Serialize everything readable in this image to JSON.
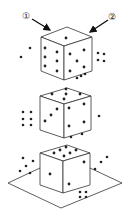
{
  "diagram": {
    "title": "",
    "labels": [
      {
        "id": "view-1",
        "text": "①",
        "x": 22,
        "y": 11
      },
      {
        "id": "view-2",
        "text": "②",
        "x": 108,
        "y": 12
      }
    ],
    "arrows": [
      {
        "from": [
          32,
          19
        ],
        "to": [
          50,
          30
        ]
      },
      {
        "from": [
          108,
          20
        ],
        "to": [
          90,
          32
        ]
      }
    ],
    "colors": {
      "stroke": "#333333",
      "dot": "#222222",
      "background": "#ffffff"
    },
    "dice": [
      {
        "name": "top-die",
        "top": [
          67,
          27
        ],
        "left": [
          41,
          37
        ],
        "right": [
          92,
          37
        ],
        "front": [
          64,
          46
        ],
        "height": 34,
        "faces": {
          "top": 1,
          "left": 6,
          "right": 5
        },
        "dots": [
          [
            66,
            38
          ],
          [
            45,
            48
          ],
          [
            45,
            57
          ],
          [
            45,
            66
          ],
          [
            57,
            52
          ],
          [
            57,
            61
          ],
          [
            57,
            71
          ],
          [
            70,
            54
          ],
          [
            84,
            50
          ],
          [
            77,
            61
          ],
          [
            70,
            71
          ],
          [
            84,
            67
          ]
        ],
        "outside_dots": [
          [
            21,
            57
          ],
          [
            30,
            48
          ],
          [
            98,
            53
          ],
          [
            104,
            54
          ],
          [
            98,
            60
          ],
          [
            104,
            61
          ],
          [
            77,
            78
          ],
          [
            81,
            76
          ],
          [
            85,
            74
          ]
        ]
      },
      {
        "name": "middle-die",
        "top": [
          67,
          88
        ],
        "left": [
          40,
          96
        ],
        "right": [
          91,
          96
        ],
        "front": [
          64,
          104
        ],
        "height": 34,
        "faces": {
          "top": 5,
          "left": 3,
          "right": 4
        },
        "dots": [
          [
            52,
            94
          ],
          [
            66,
            89
          ],
          [
            66,
            94
          ],
          [
            80,
            94
          ],
          [
            64,
            99
          ],
          [
            57,
            109
          ],
          [
            51,
            115
          ],
          [
            45,
            121
          ],
          [
            69,
            108
          ],
          [
            84,
            104
          ],
          [
            69,
            126
          ],
          [
            84,
            122
          ]
        ],
        "outside_dots": [
          [
            23,
            112
          ],
          [
            31,
            112
          ],
          [
            23,
            119
          ],
          [
            31,
            119
          ],
          [
            23,
            125
          ],
          [
            31,
            125
          ],
          [
            99,
            116
          ],
          [
            71,
            137
          ],
          [
            82,
            134
          ]
        ]
      },
      {
        "name": "bottom-die",
        "top": [
          67,
          145
        ],
        "left": [
          40,
          153
        ],
        "right": [
          90,
          153
        ],
        "front": [
          63,
          161
        ],
        "height": 32,
        "faces": {
          "top": 6,
          "left": 1,
          "right": 2
        },
        "dots": [
          [
            54,
            153
          ],
          [
            60,
            150
          ],
          [
            66,
            147
          ],
          [
            64,
            156
          ],
          [
            70,
            153
          ],
          [
            76,
            150
          ],
          [
            50,
            174
          ],
          [
            84,
            162
          ],
          [
            69,
            184
          ]
        ],
        "outside_dots": [
          [
            23,
            158
          ],
          [
            33,
            161
          ],
          [
            26,
            166
          ],
          [
            20,
            171
          ],
          [
            30,
            173
          ],
          [
            107,
            157
          ],
          [
            101,
            162
          ],
          [
            95,
            169
          ],
          [
            80,
            192
          ],
          [
            86,
            192
          ],
          [
            80,
            197
          ],
          [
            86,
            197
          ]
        ]
      }
    ],
    "plane": {
      "points": [
        [
          8,
          183
        ],
        [
          40,
          168
        ],
        [
          90,
          168
        ],
        [
          122,
          183
        ],
        [
          61,
          208
        ]
      ]
    }
  }
}
